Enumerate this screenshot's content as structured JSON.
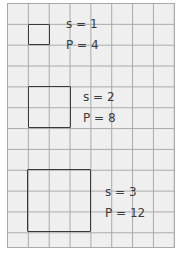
{
  "figure": {
    "grid": {
      "columns": 8,
      "rows": 12,
      "line_color": "#a9a9a9",
      "paper_color": "#efefef"
    },
    "items": [
      {
        "s_label": "s = 1",
        "p_label": "P = 4",
        "side": 1,
        "perimeter": 4
      },
      {
        "s_label": "s = 2",
        "p_label": "P = 8",
        "side": 2,
        "perimeter": 8
      },
      {
        "s_label": "s = 3",
        "p_label": "P = 12",
        "side": 3,
        "perimeter": 12
      }
    ]
  }
}
